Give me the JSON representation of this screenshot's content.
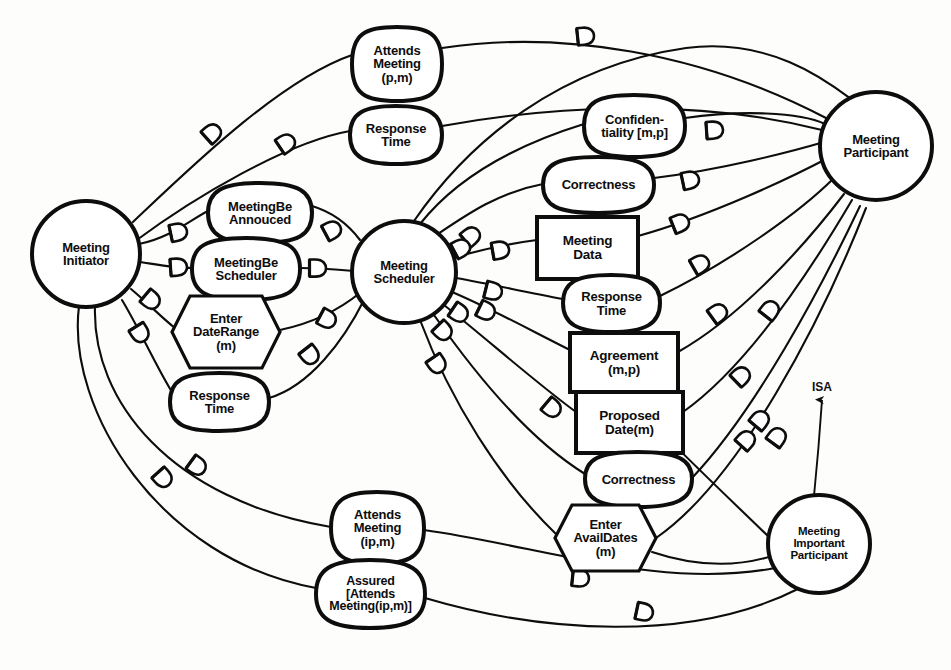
{
  "diagram": {
    "colors": {
      "ink": "#0d0d0d",
      "paper": "#fdfdfb"
    },
    "actors": [
      {
        "id": "meeting-initiator",
        "label_lines": [
          "Meeting",
          "Initiator"
        ],
        "shape": "circle",
        "cx": 86,
        "cy": 254,
        "rx": 54,
        "ry": 53,
        "font": 13
      },
      {
        "id": "meeting-scheduler",
        "label_lines": [
          "Meeting",
          "Scheduler"
        ],
        "shape": "circle",
        "cx": 404,
        "cy": 272,
        "rx": 52,
        "ry": 51,
        "font": 13
      },
      {
        "id": "meeting-participant",
        "label_lines": [
          "Meeting",
          "Participant"
        ],
        "shape": "circle",
        "cx": 876,
        "cy": 146,
        "rx": 56,
        "ry": 54,
        "font": 13
      },
      {
        "id": "meeting-important-participant",
        "label_lines": [
          "Meeting",
          "Important",
          "Participant"
        ],
        "shape": "circle",
        "cx": 819,
        "cy": 544,
        "rx": 51,
        "ry": 49,
        "font": 11.5
      }
    ],
    "intentional_elements": [
      {
        "id": "attends-meeting-pm",
        "label_lines": [
          "Attends",
          "Meeting",
          "(p,m)"
        ],
        "type": "softgoal",
        "x": 352,
        "y": 27,
        "w": 90,
        "h": 74,
        "font": 13
      },
      {
        "id": "response-time-top",
        "label_lines": [
          "Response",
          "Time"
        ],
        "type": "softgoal",
        "x": 350,
        "y": 106,
        "w": 92,
        "h": 58,
        "font": 13
      },
      {
        "id": "confidentiality-mp",
        "label_lines": [
          "Confiden-",
          "tiality [m,p]"
        ],
        "type": "softgoal",
        "x": 584,
        "y": 95,
        "w": 101,
        "h": 62,
        "font": 13
      },
      {
        "id": "correctness-upper",
        "label_lines": [
          "Correctness"
        ],
        "type": "softgoal",
        "x": 543,
        "y": 157,
        "w": 111,
        "h": 56,
        "font": 13
      },
      {
        "id": "meeting-data",
        "label_lines": [
          "Meeting",
          "Data"
        ],
        "type": "resource",
        "x": 537,
        "y": 217,
        "w": 101,
        "h": 62,
        "font": 13.5
      },
      {
        "id": "response-time-mid",
        "label_lines": [
          "Response",
          "Time"
        ],
        "type": "softgoal",
        "x": 563,
        "y": 275,
        "w": 97,
        "h": 57,
        "font": 13
      },
      {
        "id": "agreement-mp",
        "label_lines": [
          "Agreement",
          "(m,p)"
        ],
        "type": "goal-box",
        "x": 570,
        "y": 333,
        "w": 108,
        "h": 59,
        "font": 13.5
      },
      {
        "id": "proposed-date-m",
        "label_lines": [
          "Proposed",
          "Date(m)"
        ],
        "type": "goal-box",
        "x": 576,
        "y": 392,
        "w": 107,
        "h": 61,
        "font": 13.5
      },
      {
        "id": "correctness-lower",
        "label_lines": [
          "Correctness"
        ],
        "type": "softgoal",
        "x": 585,
        "y": 452,
        "w": 107,
        "h": 55,
        "font": 13
      },
      {
        "id": "enter-availdates-m",
        "label_lines": [
          "Enter",
          "AvailDates",
          "(m)"
        ],
        "type": "task",
        "x": 555,
        "y": 505,
        "w": 101,
        "h": 66,
        "font": 13
      },
      {
        "id": "meetingbe-annouced",
        "label_lines": [
          "MeetingBe",
          "Annouced"
        ],
        "type": "softgoal",
        "x": 208,
        "y": 183,
        "w": 104,
        "h": 60,
        "font": 13
      },
      {
        "id": "meetingbe-scheduler",
        "label_lines": [
          "MeetingBe",
          "Scheduler"
        ],
        "type": "softgoal",
        "x": 192,
        "y": 238,
        "w": 108,
        "h": 62,
        "font": 13
      },
      {
        "id": "enter-daterange-m",
        "label_lines": [
          "Enter",
          "DateRange",
          "(m)"
        ],
        "type": "task",
        "x": 172,
        "y": 296,
        "w": 108,
        "h": 72,
        "font": 13
      },
      {
        "id": "response-time-low",
        "label_lines": [
          "Response",
          "Time"
        ],
        "type": "softgoal",
        "x": 170,
        "y": 373,
        "w": 99,
        "h": 58,
        "font": 13
      },
      {
        "id": "attends-meeting-ipm",
        "label_lines": [
          "Attends",
          "Meeting",
          "(ip,m)"
        ],
        "type": "softgoal",
        "x": 331,
        "y": 492,
        "w": 93,
        "h": 72,
        "font": 13
      },
      {
        "id": "assured-attends-meeting",
        "label_lines": [
          "Assured",
          "[Attends",
          "Meeting(ip,m)]"
        ],
        "type": "softgoal",
        "x": 316,
        "y": 560,
        "w": 109,
        "h": 68,
        "font": 12.5
      }
    ],
    "isa_link": {
      "label": "ISA",
      "from": "meeting-important-participant",
      "to": "meeting-participant",
      "x": 812,
      "y": 387
    },
    "legend_notes": {
      "dependency_marker": "D-shaped dependency link symbol placed on each dependency edge",
      "link_count": 41
    }
  }
}
